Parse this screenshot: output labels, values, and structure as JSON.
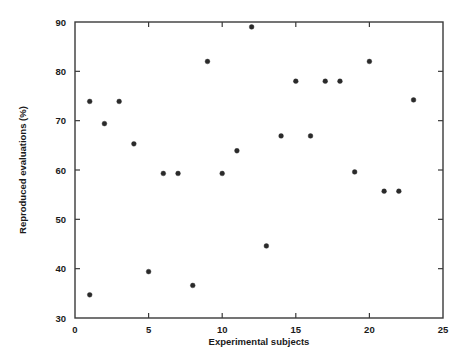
{
  "chart_data": {
    "type": "scatter",
    "title": "",
    "xlabel": "Experimental subjects",
    "ylabel": "Reproduced evaluations (%)",
    "xlim": [
      0,
      25
    ],
    "ylim": [
      30,
      90
    ],
    "xticks": [
      0,
      5,
      10,
      15,
      20,
      25
    ],
    "yticks": [
      30,
      40,
      50,
      60,
      70,
      80,
      90
    ],
    "xtick_labels": [
      "0",
      "5",
      "10",
      "15",
      "20",
      "25"
    ],
    "ytick_labels": [
      "30",
      "40",
      "50",
      "60",
      "70",
      "80",
      "90"
    ],
    "grid": false,
    "legend": null,
    "marker": "circle",
    "marker_color": "#2a2a2a",
    "x": [
      1,
      1,
      2,
      3,
      4,
      5,
      6,
      7,
      8,
      9,
      10,
      11,
      12,
      13,
      14,
      15,
      16,
      17,
      18,
      19,
      20,
      21,
      22,
      23
    ],
    "y": [
      73.9,
      34.7,
      69.4,
      73.9,
      65.3,
      39.4,
      59.3,
      59.3,
      36.6,
      82.0,
      59.3,
      63.9,
      89.0,
      44.6,
      66.9,
      78.0,
      66.9,
      78.0,
      78.0,
      59.6,
      82.0,
      55.7,
      55.7,
      74.2
    ],
    "points": [
      {
        "x": 1,
        "y": 73.9
      },
      {
        "x": 1,
        "y": 34.7
      },
      {
        "x": 2,
        "y": 69.4
      },
      {
        "x": 3,
        "y": 73.9
      },
      {
        "x": 4,
        "y": 65.3
      },
      {
        "x": 5,
        "y": 39.4
      },
      {
        "x": 6,
        "y": 59.3
      },
      {
        "x": 7,
        "y": 59.3
      },
      {
        "x": 8,
        "y": 36.6
      },
      {
        "x": 9,
        "y": 82.0
      },
      {
        "x": 10,
        "y": 59.3
      },
      {
        "x": 11,
        "y": 63.9
      },
      {
        "x": 12,
        "y": 89.0
      },
      {
        "x": 13,
        "y": 44.6
      },
      {
        "x": 14,
        "y": 66.9
      },
      {
        "x": 15,
        "y": 78.0
      },
      {
        "x": 16,
        "y": 66.9
      },
      {
        "x": 17,
        "y": 78.0
      },
      {
        "x": 18,
        "y": 78.0
      },
      {
        "x": 19,
        "y": 59.6
      },
      {
        "x": 20,
        "y": 82.0
      },
      {
        "x": 21,
        "y": 55.7
      },
      {
        "x": 22,
        "y": 55.7
      },
      {
        "x": 23,
        "y": 74.2
      }
    ]
  },
  "axes": {
    "x_title": "Experimental subjects",
    "y_title": "Reproduced evaluations (%)"
  }
}
